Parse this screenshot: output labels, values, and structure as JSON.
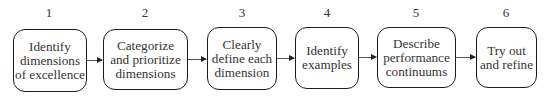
{
  "diagram": {
    "type": "flowchart",
    "direction": "left-to-right",
    "steps": [
      {
        "number": "1",
        "label": "Identify\ndimensions\nof excellence"
      },
      {
        "number": "2",
        "label": "Categorize\nand prioritize\ndimensions"
      },
      {
        "number": "3",
        "label": "Clearly\ndefine each\ndimension"
      },
      {
        "number": "4",
        "label": "Identify\nexamples"
      },
      {
        "number": "5",
        "label": "Describe\nperformance\ncontinuums"
      },
      {
        "number": "6",
        "label": "Try out\nand refine"
      }
    ],
    "edges": [
      {
        "from": "1",
        "to": "2"
      },
      {
        "from": "2",
        "to": "3"
      },
      {
        "from": "3",
        "to": "4"
      },
      {
        "from": "4",
        "to": "5"
      },
      {
        "from": "5",
        "to": "6"
      }
    ]
  }
}
